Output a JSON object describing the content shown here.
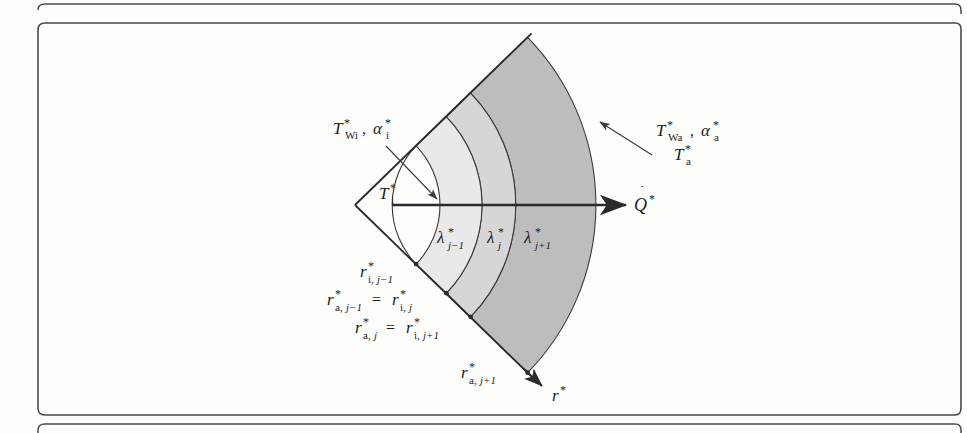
{
  "figure": {
    "type": "multilayer-cylindrical-wall-heat-conduction",
    "apex": {
      "x": 355,
      "y": 205
    },
    "geometry": {
      "half_angle_deg": 44,
      "radii": [
        85,
        127,
        161,
        240
      ],
      "radius_names": [
        "r_i_jm1",
        "r_a_jm1_eq_r_i_j",
        "r_a_j_eq_r_i_jp1",
        "r_a_jp1"
      ]
    },
    "colors": {
      "band_1": "#e9e9e9",
      "band_2": "#d6d6d6",
      "band_3": "#bdbdbd",
      "line": "#2b2b2b",
      "frame": "#4a4a4a",
      "page": "#fdfdfc"
    },
    "labels": {
      "inner_wall": "T*Wi, α*i",
      "inner_fluid": "T*i",
      "outer_wall": "T*Wa, α*a",
      "outer_fluid": "T*a",
      "heat_flow": "Q̇*",
      "radial_axis": "r*",
      "lambda_1": "λ*j−1",
      "lambda_2": "λ*j",
      "lambda_3": "λ*j+1",
      "radius_1": "r*i,j−1",
      "radius_2": "r*a,j−1 = r*i,j",
      "radius_3": "r*a,j = r*i,j+1",
      "radius_4": "r*a,j+1"
    }
  }
}
